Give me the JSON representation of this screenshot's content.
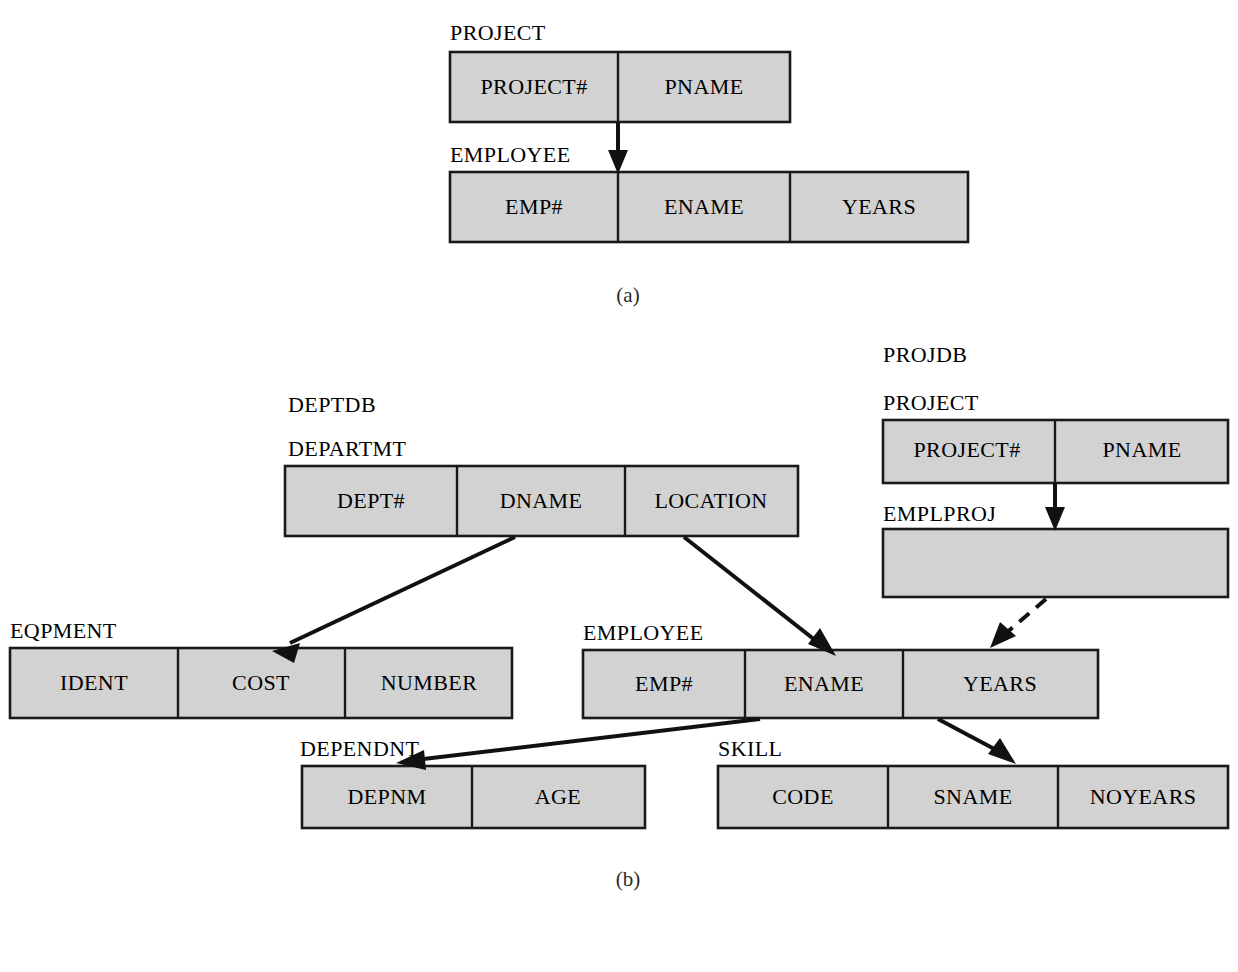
{
  "figure": {
    "fill_color": "#d2d2d2",
    "line_color": "#111111",
    "background": "#ffffff"
  },
  "panels": [
    {
      "caption": "(a)",
      "databases": [
        {
          "name": "",
          "tables": [
            {
              "name": "PROJECT",
              "columns": [
                "PROJECT#",
                "PNAME"
              ]
            },
            {
              "name": "EMPLOYEE",
              "columns": [
                "EMP#",
                "ENAME",
                "YEARS"
              ]
            }
          ]
        }
      ],
      "links": [
        {
          "from": "PROJECT.PROJECT#",
          "to": "EMPLOYEE.EMP#",
          "style": "solid"
        }
      ]
    },
    {
      "caption": "(b)",
      "databases": [
        {
          "name": "DEPTDB",
          "tables": [
            {
              "name": "DEPARTMT",
              "columns": [
                "DEPT#",
                "DNAME",
                "LOCATION"
              ]
            },
            {
              "name": "EQPMENT",
              "columns": [
                "IDENT",
                "COST",
                "NUMBER"
              ]
            },
            {
              "name": "EMPLOYEE",
              "columns": [
                "EMP#",
                "ENAME",
                "YEARS"
              ]
            },
            {
              "name": "DEPENDNT",
              "columns": [
                "DEPNM",
                "AGE"
              ]
            },
            {
              "name": "SKILL",
              "columns": [
                "CODE",
                "SNAME",
                "NOYEARS"
              ]
            }
          ]
        },
        {
          "name": "PROJDB",
          "tables": [
            {
              "name": "PROJECT",
              "columns": [
                "PROJECT#",
                "PNAME"
              ]
            },
            {
              "name": "EMPLPROJ",
              "columns": []
            }
          ]
        }
      ],
      "links": [
        {
          "from": "DEPARTMT.DNAME",
          "to": "EQPMENT.COST",
          "style": "solid"
        },
        {
          "from": "DEPARTMT.LOCATION",
          "to": "EMPLOYEE.ENAME",
          "style": "solid"
        },
        {
          "from": "PROJECT.PROJECT#",
          "to": "EMPLPROJ",
          "style": "solid"
        },
        {
          "from": "EMPLPROJ",
          "to": "EMPLOYEE.YEARS",
          "style": "dashed"
        },
        {
          "from": "EMPLOYEE.ENAME",
          "to": "DEPENDNT.DEPNM",
          "style": "solid"
        },
        {
          "from": "EMPLOYEE.YEARS",
          "to": "SKILL.SNAME",
          "style": "solid"
        }
      ]
    }
  ],
  "labels": {
    "a_project_title": "PROJECT",
    "a_project_col1": "PROJECT#",
    "a_project_col2": "PNAME",
    "a_employee_title": "EMPLOYEE",
    "a_employee_col1": "EMP#",
    "a_employee_col2": "ENAME",
    "a_employee_col3": "YEARS",
    "a_caption": "(a)",
    "b_deptdb": "DEPTDB",
    "b_departmt_title": "DEPARTMT",
    "b_departmt_col1": "DEPT#",
    "b_departmt_col2": "DNAME",
    "b_departmt_col3": "LOCATION",
    "b_eqpment_title": "EQPMENT",
    "b_eqpment_col1": "IDENT",
    "b_eqpment_col2": "COST",
    "b_eqpment_col3": "NUMBER",
    "b_employee_title": "EMPLOYEE",
    "b_employee_col1": "EMP#",
    "b_employee_col2": "ENAME",
    "b_employee_col3": "YEARS",
    "b_dependnt_title": "DEPENDNT",
    "b_dependnt_col1": "DEPNM",
    "b_dependnt_col2": "AGE",
    "b_skill_title": "SKILL",
    "b_skill_col1": "CODE",
    "b_skill_col2": "SNAME",
    "b_skill_col3": "NOYEARS",
    "b_projdb": "PROJDB",
    "b_project_title": "PROJECT",
    "b_project_col1": "PROJECT#",
    "b_project_col2": "PNAME",
    "b_emplproj_title": "EMPLPROJ",
    "b_caption": "(b)"
  }
}
